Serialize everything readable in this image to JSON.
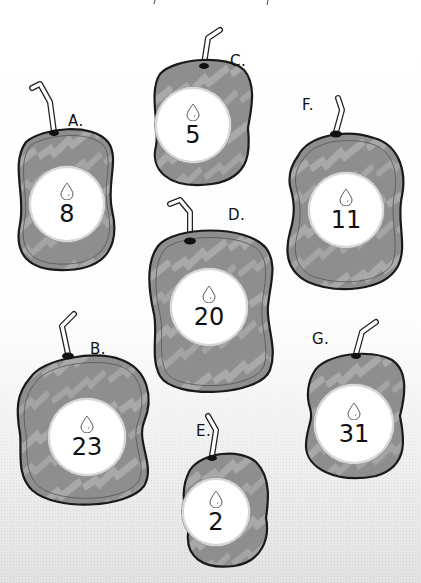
{
  "illustration": {
    "description": "Seven bag-shaped containers, each labeled with a letter, a water-drop icon and a number",
    "colors": {
      "bag_fill": "#8c8c8c",
      "bag_stripe": "#a8a8a8",
      "outline": "#1a1a1a",
      "badge_fill": "#ffffff",
      "background": "#ffffff"
    },
    "icon": "water-drop-icon",
    "bags": [
      {
        "id": "A",
        "label": "A.",
        "value": "8"
      },
      {
        "id": "B",
        "label": "B.",
        "value": "23"
      },
      {
        "id": "C",
        "label": "C.",
        "value": "5"
      },
      {
        "id": "D",
        "label": "D.",
        "value": "20"
      },
      {
        "id": "E",
        "label": "E.",
        "value": "2"
      },
      {
        "id": "F",
        "label": "F.",
        "value": "11"
      },
      {
        "id": "G",
        "label": "G.",
        "value": "31"
      }
    ]
  }
}
